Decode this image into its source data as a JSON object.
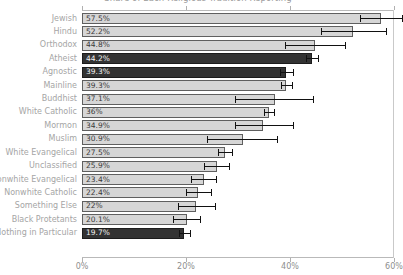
{
  "chart_data": {
    "type": "bar",
    "orientation": "horizontal",
    "title": "Share of Each Religious Tradition Reporting",
    "xlabel": "",
    "ylabel": "",
    "xlim": [
      0,
      60
    ],
    "xticks": [
      0,
      20,
      40,
      60
    ],
    "xtick_labels": [
      "0%",
      "20%",
      "40%",
      "60%"
    ],
    "grid": false,
    "legend": "none",
    "value_label_suffix": "%",
    "colors": {
      "bar": "#d6d6d6",
      "bar_highlight": "#333333",
      "bar_outline": "#5f5f5f",
      "error_bar": "#111111",
      "axis": "#b9b9b9",
      "label_text": "#a5a5a5",
      "tick_text": "#8e8e8e"
    },
    "categories": [
      "Jewish",
      "Hindu",
      "Orthodox",
      "Atheist",
      "Agnostic",
      "Mainline",
      "Buddhist",
      "White Catholic",
      "Mormon",
      "Muslim",
      "White Evangelical",
      "Unclassified",
      "Nonwhite Evangelical",
      "Nonwhite Catholic",
      "Something Else",
      "Black Protetants",
      "Nothing in Particular"
    ],
    "values": [
      57.5,
      52.2,
      44.8,
      44.2,
      39.3,
      39.3,
      37.1,
      36.0,
      34.9,
      30.9,
      27.5,
      25.9,
      23.4,
      22.4,
      22.0,
      20.1,
      19.7
    ],
    "value_labels": [
      "57.5%",
      "52.2%",
      "44.8%",
      "44.2%",
      "39.3%",
      "39.3%",
      "37.1%",
      "36%",
      "34.9%",
      "30.9%",
      "27.5%",
      "25.9%",
      "23.4%",
      "22.4%",
      "22%",
      "20.1%",
      "19.7%"
    ],
    "highlighted": [
      false,
      false,
      false,
      true,
      true,
      false,
      false,
      false,
      false,
      false,
      false,
      false,
      false,
      false,
      false,
      false,
      true
    ],
    "error_low": [
      53.5,
      46.0,
      39.0,
      43.0,
      38.0,
      38.3,
      29.5,
      35.0,
      29.5,
      24.0,
      26.2,
      23.5,
      21.0,
      20.0,
      18.5,
      17.5,
      18.7
    ],
    "error_high": [
      61.5,
      58.5,
      50.5,
      45.4,
      40.6,
      40.3,
      44.5,
      37.0,
      40.5,
      37.5,
      28.8,
      28.3,
      25.8,
      24.8,
      25.5,
      22.7,
      20.7
    ]
  }
}
